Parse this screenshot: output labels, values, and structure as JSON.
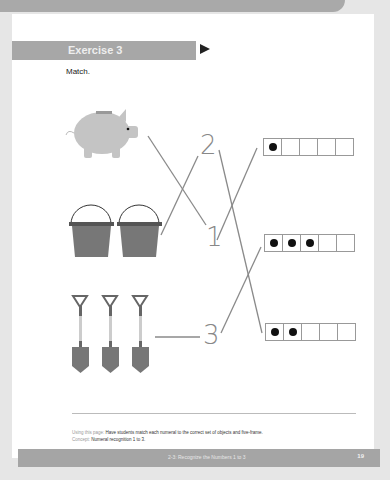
{
  "exercise": {
    "title": "Exercise 3",
    "instruction": "Match."
  },
  "objects": [
    {
      "name": "piggy-bank",
      "count": 1
    },
    {
      "name": "bucket",
      "count": 2
    },
    {
      "name": "shovel",
      "count": 3
    }
  ],
  "numerals": [
    "2",
    "1",
    "3"
  ],
  "five_frames": [
    {
      "filled": 1,
      "cells": 5
    },
    {
      "filled": 3,
      "cells": 5
    },
    {
      "filled": 2,
      "cells": 5
    }
  ],
  "notes": {
    "using_label": "Using this page:",
    "using_text": "Have students match each numeral to the correct set of objects and five-frame.",
    "concept_label": "Concept:",
    "concept_text": "Numeral recognition 1 to 3."
  },
  "footer": {
    "title": "2-3: Recognize the Numbers 1 to 3",
    "page_number": "19"
  },
  "colors": {
    "bar": "#a7a7a7",
    "line": "#888888",
    "object": "#707070"
  }
}
